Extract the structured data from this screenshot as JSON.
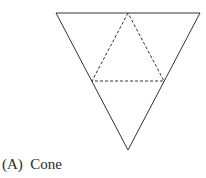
{
  "option": {
    "letter": "(A)",
    "text": "Cone",
    "full": "(A)  Cone"
  },
  "figure": {
    "outer_triangle": [
      [
        56,
        13
      ],
      [
        200,
        13
      ],
      [
        128,
        150
      ]
    ],
    "inner_dashed_triangle": [
      [
        128,
        13
      ],
      [
        92,
        81
      ],
      [
        164,
        81
      ]
    ],
    "stroke_color": "#333333"
  }
}
